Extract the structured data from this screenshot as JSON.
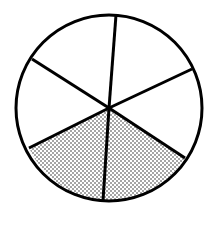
{
  "diagram": {
    "type": "fraction-circle",
    "total_parts": 6,
    "shaded_parts": 2,
    "fraction": "2/6",
    "center": [
      109,
      108
    ],
    "radius": 93,
    "stroke_color": "#000000",
    "fill_color": "#ffffff",
    "shade_pattern": "stipple",
    "spoke_endpoints": [
      [
        116,
        15
      ],
      [
        192,
        69
      ],
      [
        185,
        158
      ],
      [
        103,
        201
      ],
      [
        29,
        148
      ],
      [
        32,
        59
      ]
    ],
    "shaded_sectors": [
      2,
      3
    ]
  }
}
